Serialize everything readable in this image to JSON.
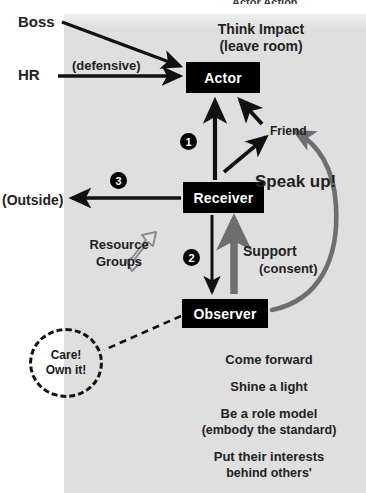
{
  "title": "Actor Action",
  "colors": {
    "panel": "#dcdcdc",
    "node_fill": "#000000",
    "node_text": "#ffffff",
    "ink": "#222222",
    "gray_arrow": "#6e6e6e",
    "hollow_arrow_stroke": "#8c8c8c"
  },
  "nodes": [
    {
      "id": "actor",
      "label": "Actor"
    },
    {
      "id": "receiver",
      "label": "Receiver"
    },
    {
      "id": "observer",
      "label": "Observer"
    }
  ],
  "badges": [
    {
      "id": "one",
      "number": "1"
    },
    {
      "id": "two",
      "number": "2"
    },
    {
      "id": "three",
      "number": "3"
    }
  ],
  "labels": {
    "boss": "Boss",
    "hr": "HR",
    "defensive": "(defensive)",
    "think_impact_line1": "Think Impact",
    "think_impact_line2": "(leave room)",
    "friend": "Friend",
    "speak_up": "Speak up!",
    "outside": "(Outside)",
    "resource_line1": "Resource",
    "resource_line2": "Groups",
    "support": "Support",
    "consent": "(consent)"
  },
  "care_bubble": {
    "line1": "Care!",
    "line2": "Own it!"
  },
  "bottom_list": [
    {
      "main": "Come forward",
      "sub": ""
    },
    {
      "main": "Shine a light",
      "sub": ""
    },
    {
      "main": "Be a role model",
      "sub": "(embody the standard)"
    },
    {
      "main": "Put their interests",
      "sub": "behind others'"
    }
  ]
}
